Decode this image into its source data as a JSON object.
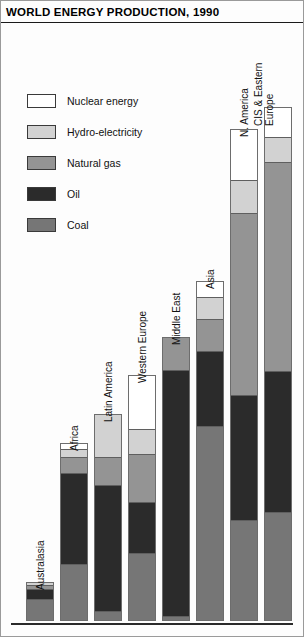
{
  "title": "WORLD ENERGY PRODUCTION, 1990",
  "legend": {
    "items": [
      {
        "label": "Nuclear energy",
        "key": "nuclear",
        "color": "#ffffff"
      },
      {
        "label": "Hydro-electricity",
        "key": "hydro",
        "color": "#d2d2d2"
      },
      {
        "label": "Natural gas",
        "key": "gas",
        "color": "#949494"
      },
      {
        "label": "Oil",
        "key": "oil",
        "color": "#2b2b2b"
      },
      {
        "label": "Coal",
        "key": "coal",
        "color": "#767676"
      }
    ]
  },
  "chart_data": {
    "type": "bar",
    "title": "WORLD ENERGY PRODUCTION, 1990",
    "subtitle": "",
    "xlabel": "",
    "ylabel": "",
    "stacked": true,
    "grid": false,
    "legend_position": "upper-left",
    "units": "relative energy production (chart has no numeric axis)",
    "categories": [
      "Australasia",
      "Africa",
      "Latin America",
      "Western Europe",
      "Middle East",
      "Asia",
      "N. America",
      "CIS & Eastern Europe"
    ],
    "series": [
      {
        "name": "Coal",
        "color": "#767676",
        "values": [
          22,
          57,
          12,
          66,
          5,
          246,
          106,
          109
        ]
      },
      {
        "name": "Oil",
        "color": "#2b2b2b",
        "values": [
          10,
          92,
          146,
          50,
          243,
          96,
          130,
          141
        ]
      },
      {
        "name": "Natural gas",
        "color": "#949494",
        "values": [
          4,
          16,
          32,
          47,
          33,
          40,
          190,
          209
        ]
      },
      {
        "name": "Hydro-electricity",
        "color": "#d2d2d2",
        "values": [
          3,
          8,
          50,
          24,
          0,
          28,
          35,
          25
        ]
      },
      {
        "name": "Nuclear energy",
        "color": "#ffffff",
        "values": [
          0,
          6,
          0,
          53,
          0,
          20,
          53,
          30
        ]
      }
    ],
    "bar_tops_px": [
      583,
      444,
      415,
      376,
      338,
      282,
      130,
      108
    ],
    "baseline_px": 622
  }
}
